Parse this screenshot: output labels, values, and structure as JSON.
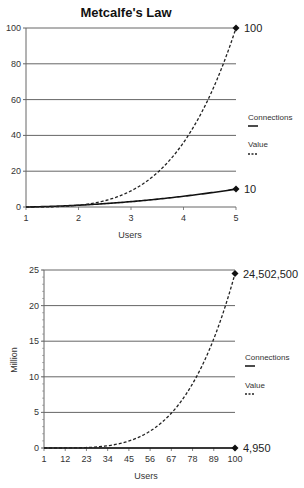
{
  "chart_data": [
    {
      "type": "line",
      "title": "Metcalfe's Law",
      "xlabel": "Users",
      "ylabel": "",
      "x": [
        1,
        2,
        3,
        4,
        5
      ],
      "xticks": [
        "1",
        "2",
        "3",
        "4",
        "5"
      ],
      "yticks": [
        "0",
        "20",
        "40",
        "60",
        "80",
        "100"
      ],
      "ylim": [
        0,
        100
      ],
      "xlim": [
        1,
        5
      ],
      "grid": "horizontal",
      "series": [
        {
          "name": "Connections",
          "style": "solid",
          "values": [
            0,
            1,
            3,
            6,
            10
          ]
        },
        {
          "name": "Value",
          "style": "dashed",
          "values": [
            0,
            1,
            9,
            36,
            100
          ]
        }
      ],
      "annotations": [
        {
          "label": "100",
          "x": 5,
          "y": 100
        },
        {
          "label": "10",
          "x": 5,
          "y": 10
        }
      ],
      "legend": {
        "position": "right",
        "entries": [
          "Connections",
          "Value"
        ]
      }
    },
    {
      "type": "line",
      "title": "",
      "xlabel": "Users",
      "ylabel": "Million",
      "x": [
        1,
        12,
        23,
        34,
        45,
        56,
        67,
        78,
        89,
        100
      ],
      "xticks": [
        "1",
        "12",
        "23",
        "34",
        "45",
        "56",
        "67",
        "78",
        "89",
        "100"
      ],
      "yticks": [
        "0",
        "5",
        "10",
        "15",
        "20",
        "25"
      ],
      "ylim": [
        0,
        25
      ],
      "xlim": [
        1,
        100
      ],
      "grid": "horizontal",
      "series": [
        {
          "name": "Connections",
          "style": "solid",
          "values": [
            0,
            6.6e-05,
            0.000253,
            0.000561,
            0.00099,
            0.00154,
            0.002211,
            0.003003,
            0.003916,
            0.00495
          ]
        },
        {
          "name": "Value",
          "style": "dashed",
          "values": [
            0,
            0.0044,
            0.064,
            0.315,
            0.98,
            2.37,
            4.89,
            9.02,
            15.33,
            24.5025
          ]
        }
      ],
      "annotations": [
        {
          "label": "24,502,500",
          "x": 100,
          "y": 24.5025
        },
        {
          "label": "4,950",
          "x": 100,
          "y": 0.00495
        }
      ],
      "legend": {
        "position": "right",
        "entries": [
          "Connections",
          "Value"
        ]
      }
    }
  ]
}
